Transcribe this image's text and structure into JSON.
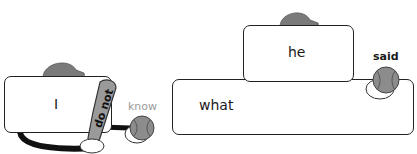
{
  "diagram": {
    "left_group": {
      "subject": "I",
      "bat_label": "do not",
      "ball_label": "know"
    },
    "right_group": {
      "subject": "he",
      "ball_label": "said",
      "base_word": "what"
    },
    "colors": {
      "cap": "#7a7a7a",
      "bat": "#9a9a9a",
      "ball": "#8c8c8c",
      "outline": "#222222",
      "arm": "#111111",
      "soft_label": "#9a9a9a"
    },
    "icons": [
      "baseball-cap-icon",
      "baseball-bat-icon",
      "baseball-icon",
      "glove-hand-icon"
    ]
  }
}
